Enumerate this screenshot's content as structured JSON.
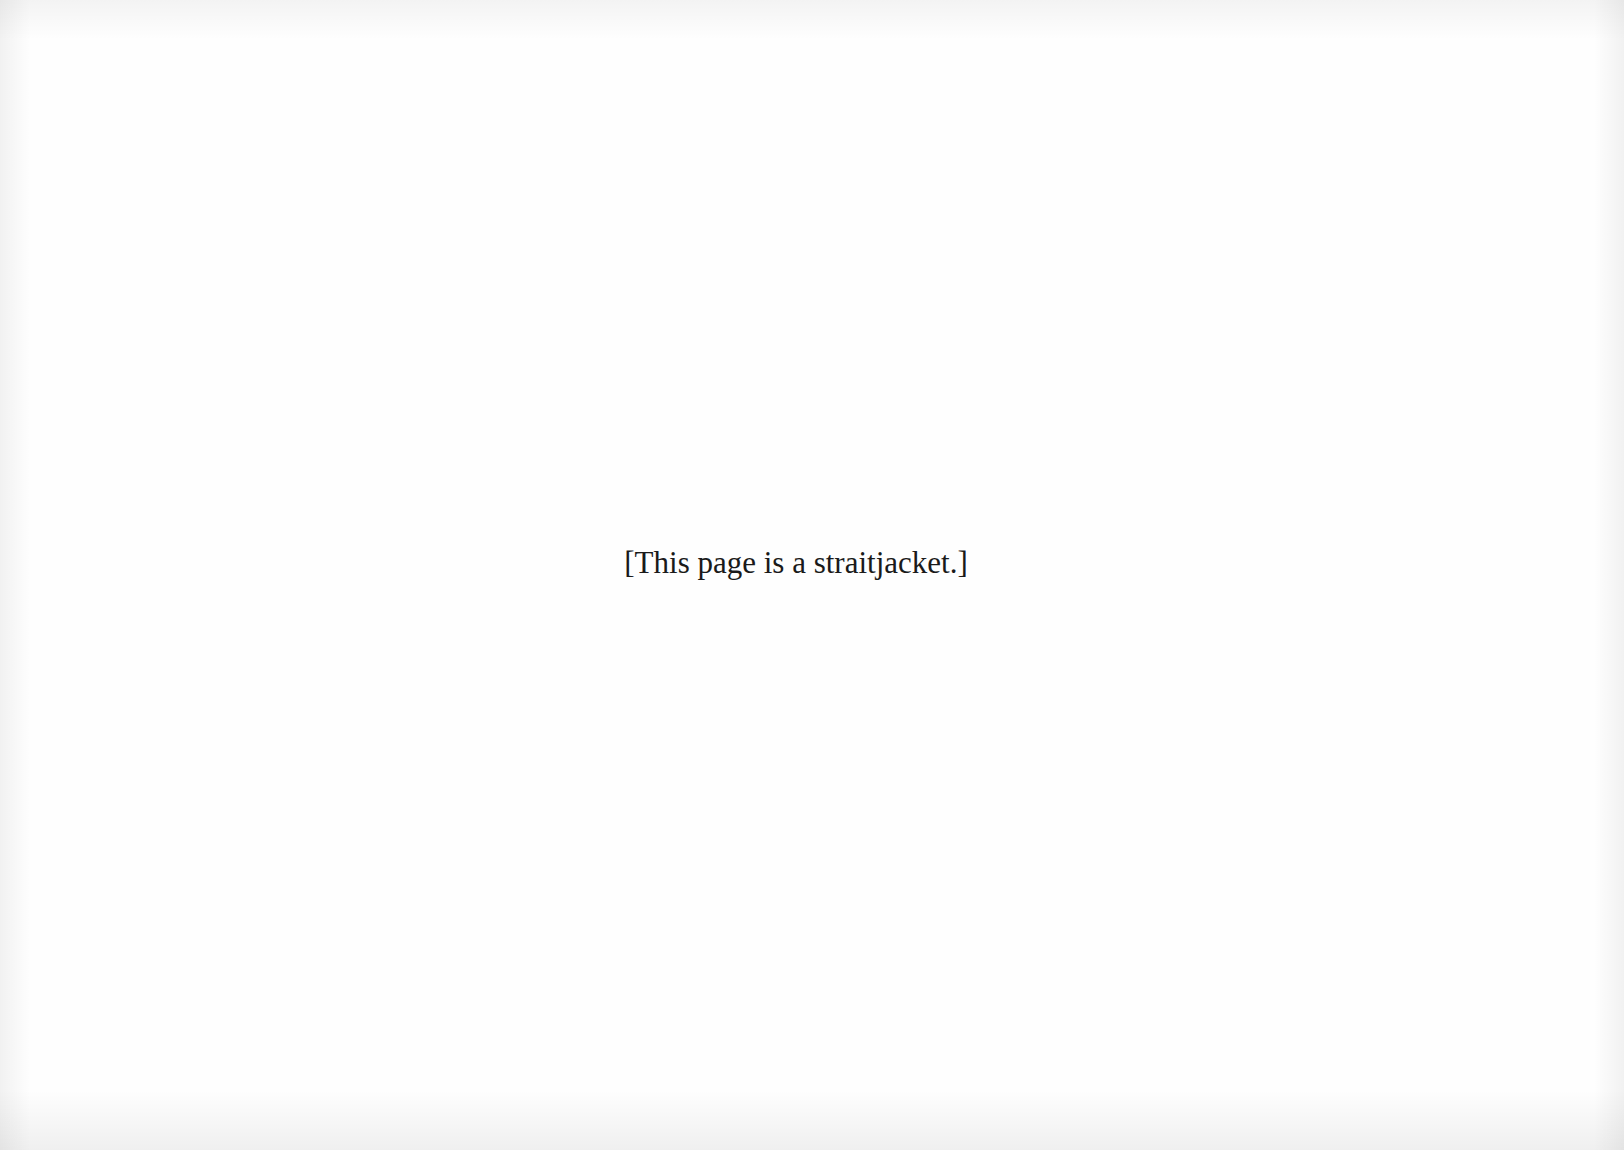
{
  "page": {
    "text": "[This page is a straitjacket.]"
  }
}
